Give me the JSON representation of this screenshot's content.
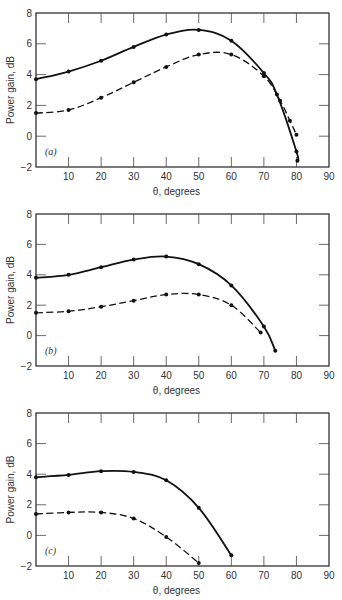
{
  "chart_data": [
    {
      "type": "line",
      "panel": "(a)",
      "xlabel": "θ, degrees",
      "ylabel": "Power gain, dB",
      "xlim": [
        0,
        90
      ],
      "ylim": [
        -2,
        8
      ],
      "xticks": [
        10,
        20,
        30,
        40,
        50,
        60,
        70,
        80,
        90
      ],
      "yticks": [
        -2,
        0,
        2,
        4,
        6,
        8
      ],
      "grid": false,
      "series": [
        {
          "name": "solid",
          "style": "solid",
          "x": [
            0,
            10,
            20,
            30,
            40,
            50,
            60,
            70,
            74,
            80,
            80.3
          ],
          "y": [
            3.7,
            4.2,
            4.9,
            5.8,
            6.6,
            6.9,
            6.2,
            4.1,
            2.7,
            -1.0,
            -1.6
          ]
        },
        {
          "name": "dashed",
          "style": "dashed",
          "x": [
            0,
            10,
            20,
            30,
            40,
            50,
            60,
            70,
            75,
            78,
            80
          ],
          "y": [
            1.5,
            1.7,
            2.5,
            3.5,
            4.5,
            5.3,
            5.3,
            3.9,
            2.3,
            1.0,
            0.1
          ]
        }
      ]
    },
    {
      "type": "line",
      "panel": "(b)",
      "xlabel": "θ, degrees",
      "ylabel": "Power gain, dB",
      "xlim": [
        0,
        90
      ],
      "ylim": [
        -2,
        8
      ],
      "xticks": [
        10,
        20,
        30,
        40,
        50,
        60,
        70,
        80,
        90
      ],
      "yticks": [
        -2,
        0,
        2,
        4,
        6,
        8
      ],
      "grid": false,
      "series": [
        {
          "name": "solid",
          "style": "solid",
          "x": [
            0,
            10,
            20,
            30,
            40,
            50,
            60,
            70,
            73.5
          ],
          "y": [
            3.8,
            4.0,
            4.5,
            5.0,
            5.2,
            4.7,
            3.3,
            0.6,
            -1.0
          ]
        },
        {
          "name": "dashed",
          "style": "dashed",
          "x": [
            0,
            10,
            20,
            30,
            40,
            50,
            60,
            69
          ],
          "y": [
            1.5,
            1.6,
            1.9,
            2.3,
            2.7,
            2.7,
            2.0,
            0.2
          ]
        }
      ]
    },
    {
      "type": "line",
      "panel": "(c)",
      "xlabel": "θ, degrees",
      "ylabel": "Power gain, dB",
      "xlim": [
        0,
        90
      ],
      "ylim": [
        -2,
        8
      ],
      "xticks": [
        10,
        20,
        30,
        40,
        50,
        60,
        70,
        80,
        90
      ],
      "yticks": [
        -2,
        0,
        2,
        4,
        6,
        8
      ],
      "grid": false,
      "series": [
        {
          "name": "solid",
          "style": "solid",
          "x": [
            0,
            10,
            20,
            30,
            40,
            50,
            60
          ],
          "y": [
            3.8,
            3.95,
            4.2,
            4.15,
            3.6,
            1.8,
            -1.3
          ]
        },
        {
          "name": "dashed",
          "style": "dashed",
          "x": [
            0,
            10,
            20,
            30,
            40,
            50
          ],
          "y": [
            1.4,
            1.5,
            1.5,
            1.1,
            -0.1,
            -1.8
          ]
        }
      ]
    }
  ],
  "panels": [
    {
      "label": "(a)",
      "xlabel": "θ, degrees",
      "ylabel": "Power gain, dB"
    },
    {
      "label": "(b)",
      "xlabel": "θ, degrees",
      "ylabel": "Power gain, dB"
    },
    {
      "label": "(c)",
      "xlabel": "θ, degrees",
      "ylabel": "Power gain, dB"
    }
  ]
}
